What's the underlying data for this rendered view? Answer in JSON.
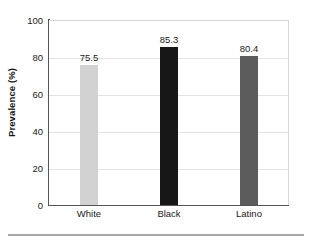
{
  "chart_data": {
    "type": "bar",
    "title": "",
    "subtitle": "",
    "xlabel": "",
    "ylabel": "Prevalence (%)",
    "categories": [
      "White",
      "Black",
      "Latino"
    ],
    "values": [
      75.5,
      85.3,
      80.4
    ],
    "value_labels": [
      "75.5",
      "85.3",
      "80.4"
    ],
    "bar_colors": [
      "#d2d2d2",
      "#171717",
      "#5c5c5c"
    ],
    "ylim": [
      0,
      100
    ],
    "yticks": [
      0,
      20,
      40,
      60,
      80,
      100
    ],
    "ytick_labels": [
      "0",
      "20",
      "40",
      "60",
      "80",
      "100"
    ],
    "grid": true,
    "grid_axis": "y",
    "legend": false,
    "legend_position": "none",
    "series": [
      {
        "name": "Prevalence",
        "values": [
          75.5,
          85.3,
          80.4
        ]
      }
    ]
  },
  "figure": {
    "background_color": "#ffffff",
    "axis_color": "#555555",
    "gridline_color": "#e3e3e3",
    "text_color": "#1a1a1a",
    "footer_rule_color": "#a8a8a8"
  }
}
